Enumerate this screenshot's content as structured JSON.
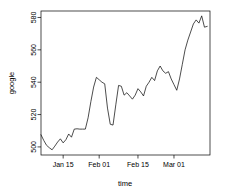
{
  "chart_data": {
    "type": "line",
    "title": "",
    "subtitle": "",
    "xlabel": "time",
    "ylabel": "google",
    "grid": false,
    "legend": false,
    "legend_position": "none",
    "line_color": "#000000",
    "background_color": "#ffffff",
    "xlim": [
      0,
      61
    ],
    "ylim": [
      495,
      584
    ],
    "ytick_values": [
      500,
      520,
      540,
      560,
      580
    ],
    "ytick_labels": [
      "500",
      "520",
      "540",
      "560",
      "580"
    ],
    "xtick_positions": [
      8,
      21,
      35,
      48
    ],
    "xtick_labels": [
      "Jan 15",
      "Feb 01",
      "Feb 15",
      "Mar 01"
    ],
    "x": [
      0,
      1,
      2,
      3,
      4,
      5,
      6,
      7,
      8,
      9,
      10,
      11,
      12,
      13,
      14,
      15,
      16,
      17,
      18,
      19,
      20,
      21,
      22,
      23,
      24,
      25,
      26,
      27,
      28,
      29,
      30,
      31,
      32,
      33,
      34,
      35,
      36,
      37,
      38,
      39,
      40,
      41,
      42,
      43,
      44,
      45,
      46,
      47,
      48,
      49,
      50,
      51,
      52,
      53,
      54,
      55,
      56,
      57,
      58,
      59,
      60
    ],
    "values": [
      507.5,
      504.0,
      501.0,
      499.5,
      498.2,
      500.5,
      503.0,
      505.0,
      502.5,
      504.5,
      508.0,
      506.0,
      511.0,
      511.2,
      511.0,
      511.0,
      511.0,
      518.0,
      528.0,
      537.0,
      543.0,
      541.5,
      540.0,
      539.0,
      524.0,
      514.0,
      513.5,
      526.0,
      538.0,
      537.5,
      532.0,
      533.5,
      531.5,
      529.5,
      532.0,
      536.0,
      534.0,
      531.5,
      537.5,
      540.0,
      543.0,
      541.0,
      547.0,
      550.0,
      547.0,
      545.5,
      546.5,
      542.0,
      538.5,
      535.0,
      542.0,
      551.0,
      560.0,
      566.0,
      571.0,
      576.0,
      578.5,
      576.5,
      581.0,
      574.0,
      574.5
    ],
    "series_name": "google",
    "n_points": 61,
    "y_min_observed": 498.2,
    "y_max_observed": 581.0
  },
  "figure": {
    "plot_area": {
      "left": 41,
      "top": 11,
      "right": 210,
      "bottom": 155
    },
    "y_axis_title": "google",
    "x_axis_title": "time"
  }
}
